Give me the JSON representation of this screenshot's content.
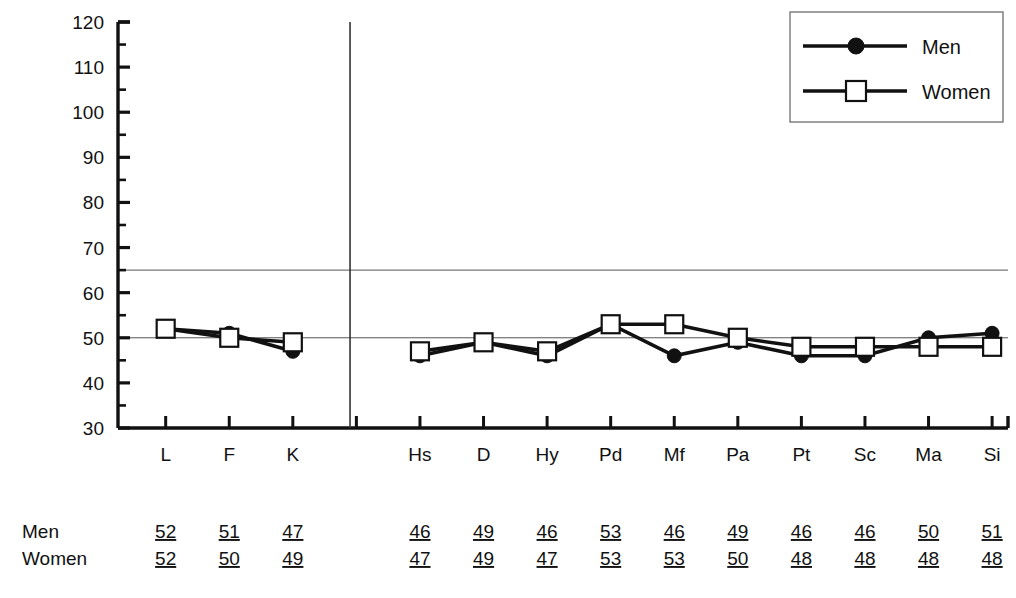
{
  "chart_data": {
    "type": "line",
    "title": "",
    "xlabel": "",
    "ylabel": "",
    "ylim": [
      30,
      120
    ],
    "y_major_ticks": [
      30,
      40,
      50,
      60,
      70,
      80,
      90,
      100,
      110,
      120
    ],
    "y_minor_step": 5,
    "grid": false,
    "legend_position": "top-right",
    "reference_lines": [
      65,
      50
    ],
    "group_divider_after_index": 2,
    "categories": [
      "L",
      "F",
      "K",
      "Hs",
      "D",
      "Hy",
      "Pd",
      "Mf",
      "Pa",
      "Pt",
      "Sc",
      "Ma",
      "Si"
    ],
    "series": [
      {
        "name": "Men",
        "marker": "filled-circle",
        "values": [
          52,
          51,
          47,
          46,
          49,
          46,
          53,
          46,
          49,
          46,
          46,
          50,
          51
        ]
      },
      {
        "name": "Women",
        "marker": "open-square",
        "values": [
          52,
          50,
          49,
          47,
          49,
          47,
          53,
          53,
          50,
          48,
          48,
          48,
          48
        ]
      }
    ]
  },
  "legend": {
    "entries": [
      {
        "label": "Men",
        "marker": "filled-circle"
      },
      {
        "label": "Women",
        "marker": "open-square"
      }
    ]
  },
  "axis": {
    "y_ticks": [
      "120",
      "110",
      "100",
      "90",
      "80",
      "70",
      "60",
      "50",
      "40",
      "30"
    ],
    "x_ticks": [
      "L",
      "F",
      "K",
      "Hs",
      "D",
      "Hy",
      "Pd",
      "Mf",
      "Pa",
      "Pt",
      "Sc",
      "Ma",
      "Si"
    ]
  },
  "data_table": {
    "rows": [
      {
        "label": "Men",
        "values": [
          "52",
          "51",
          "47",
          "46",
          "49",
          "46",
          "53",
          "46",
          "49",
          "46",
          "46",
          "50",
          "51"
        ]
      },
      {
        "label": "Women",
        "values": [
          "52",
          "50",
          "49",
          "47",
          "49",
          "47",
          "53",
          "53",
          "50",
          "48",
          "48",
          "48",
          "48"
        ]
      }
    ]
  }
}
